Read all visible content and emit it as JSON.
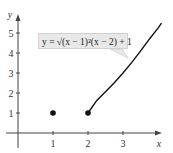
{
  "chart_data": {
    "type": "line",
    "title": "",
    "xlabel": "x",
    "ylabel": "y",
    "xlim": [
      0,
      4.1
    ],
    "ylim": [
      0,
      6
    ],
    "x_ticks": [
      1,
      2,
      3
    ],
    "y_ticks": [
      1,
      2,
      3,
      4,
      5
    ],
    "grid": false,
    "annotation": "y = √((x − 1)²(x − 2)) + 1",
    "series": [
      {
        "name": "y = √((x − 1)²(x − 2)) + 1",
        "kind": "curve",
        "x": [
          2,
          2.25,
          2.5,
          2.75,
          3,
          3.25,
          3.5,
          3.75,
          4,
          4.1
        ],
        "values": [
          1,
          1.63,
          2.06,
          2.51,
          3,
          3.53,
          4.09,
          4.69,
          5.24,
          5.49
        ]
      },
      {
        "name": "isolated points",
        "kind": "scatter",
        "x": [
          1,
          2
        ],
        "values": [
          1,
          1
        ]
      }
    ]
  },
  "labels": {
    "x_axis": "x",
    "y_axis": "y",
    "x_ticks": [
      "1",
      "2",
      "3"
    ],
    "y_ticks": [
      "1",
      "2",
      "3",
      "4",
      "5"
    ],
    "formula": "y = √(x − 1)²(x − 2) + 1"
  }
}
